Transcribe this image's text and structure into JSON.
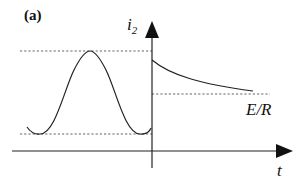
{
  "figure": {
    "panel_label": "(a)",
    "y_axis": {
      "label": "i",
      "subscript": "2"
    },
    "x_axis": {
      "label": "t"
    },
    "annotations": {
      "steady_state": "E/R"
    }
  },
  "colors": {
    "line": "#222222",
    "dashed": "#555555",
    "background": "#ffffff"
  },
  "geometry": {
    "origin_x": 152,
    "x_axis_y": 151,
    "y_axis_top": 22,
    "x_axis_right": 293,
    "level_max_y": 51,
    "level_min_y": 134,
    "level_er_y": 94,
    "decay_start_y": 60,
    "decay_end_x": 253,
    "decay_end_y": 91
  }
}
